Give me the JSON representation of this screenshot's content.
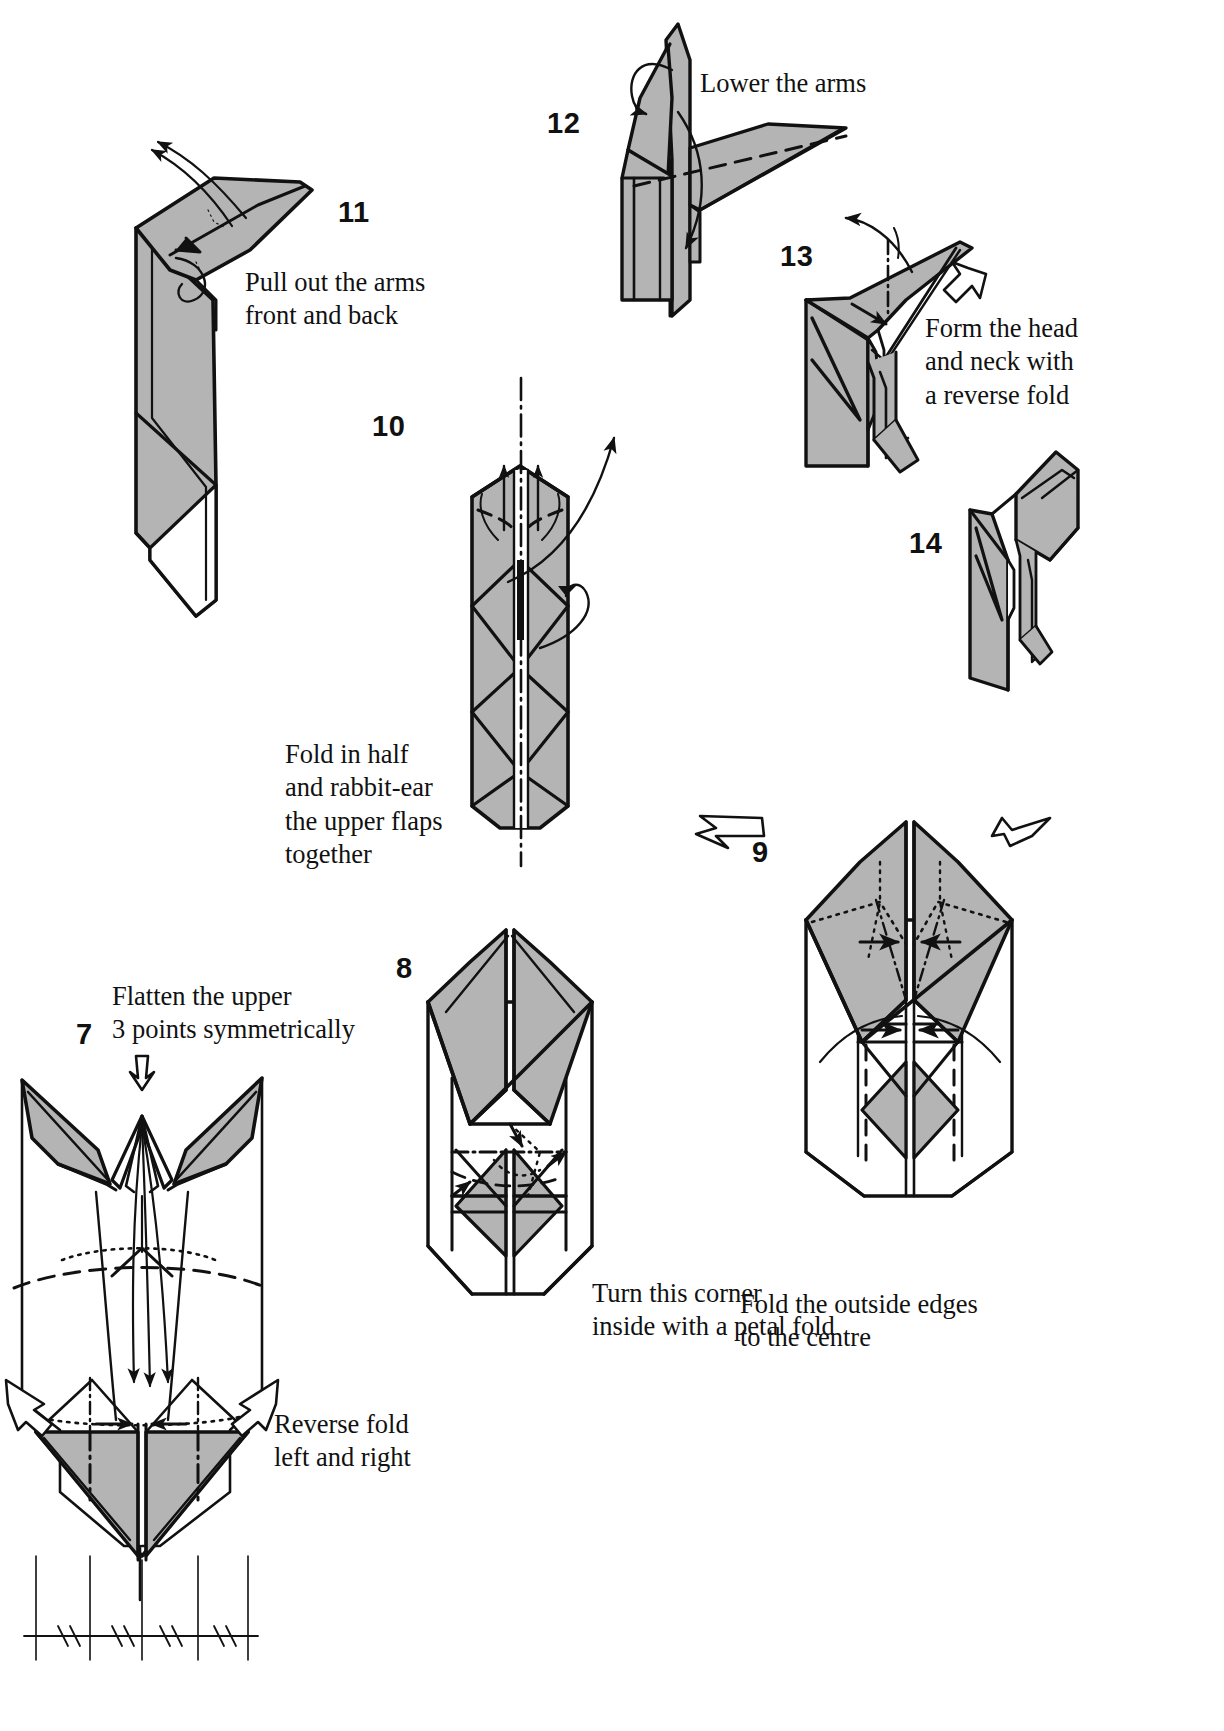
{
  "document": {
    "type": "origami-instruction-diagram",
    "title": "Origami folding sequence, steps 7-14",
    "background_color": "#ffffff",
    "ink_color": "#111111",
    "paper_shade_color": "#b3b3b3",
    "paper_white_color": "#ffffff"
  },
  "steps": [
    {
      "id": "step-7",
      "number": "7",
      "number_pos": {
        "x": 76,
        "y": 1018
      },
      "captions": [
        {
          "id": "caption-7-top",
          "text": "Flatten the upper\n3 points symmetrically",
          "x": 112,
          "y": 980
        },
        {
          "id": "caption-7-bottom",
          "text": "Reverse fold\nleft and right",
          "x": 274,
          "y": 1408
        }
      ]
    },
    {
      "id": "step-8",
      "number": "8",
      "number_pos": {
        "x": 396,
        "y": 952
      },
      "captions": [
        {
          "id": "caption-8",
          "text": "Turn this corner\ninside with a petal fold",
          "x": 592,
          "y": 1277
        }
      ]
    },
    {
      "id": "step-9",
      "number": "9",
      "number_pos": {
        "x": 752,
        "y": 836
      },
      "captions": [
        {
          "id": "caption-9",
          "text": "Fold the outside edges\nto the centre",
          "x": 740,
          "y": 1288
        }
      ]
    },
    {
      "id": "step-10",
      "number": "10",
      "number_pos": {
        "x": 372,
        "y": 410
      },
      "captions": [
        {
          "id": "caption-10",
          "text": "Fold in half\nand rabbit-ear\nthe upper flaps\ntogether",
          "x": 285,
          "y": 738
        }
      ]
    },
    {
      "id": "step-11",
      "number": "11",
      "number_pos": {
        "x": 338,
        "y": 196
      },
      "captions": [
        {
          "id": "caption-11",
          "text": "Pull out the arms\nfront and back",
          "x": 245,
          "y": 266
        }
      ]
    },
    {
      "id": "step-12",
      "number": "12",
      "number_pos": {
        "x": 547,
        "y": 107
      },
      "captions": [
        {
          "id": "caption-12",
          "text": "Lower the arms",
          "x": 700,
          "y": 67
        }
      ]
    },
    {
      "id": "step-13",
      "number": "13",
      "number_pos": {
        "x": 780,
        "y": 240
      },
      "captions": [
        {
          "id": "caption-13",
          "text": "Form the head\nand neck with\na reverse fold",
          "x": 925,
          "y": 312
        }
      ]
    },
    {
      "id": "step-14",
      "number": "14",
      "number_pos": {
        "x": 909,
        "y": 527
      },
      "captions": []
    }
  ],
  "legend": {
    "symbols": [
      {
        "name": "valley-fold-dashed-line",
        "description": "dashed line"
      },
      {
        "name": "mountain-fold-dash-dot-line",
        "description": "dash-dot line"
      },
      {
        "name": "hidden-edge-dotted-line",
        "description": "dotted line"
      },
      {
        "name": "fold-arrow",
        "description": "solid arrow"
      },
      {
        "name": "push-here-hollow-arrow",
        "description": "hollow arrow"
      }
    ]
  }
}
